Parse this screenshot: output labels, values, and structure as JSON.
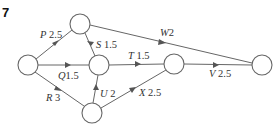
{
  "question_number": "7",
  "nodes": [
    {
      "id": "start",
      "cx": 28,
      "cy": 65
    },
    {
      "id": "top",
      "cx": 80,
      "cy": 24
    },
    {
      "id": "mid",
      "cx": 99,
      "cy": 65
    },
    {
      "id": "bottom",
      "cx": 92,
      "cy": 113
    },
    {
      "id": "right",
      "cx": 174,
      "cy": 64
    },
    {
      "id": "end",
      "cx": 262,
      "cy": 65
    }
  ],
  "edges": [
    {
      "name": "P",
      "weight": "2.5",
      "from": "start",
      "to": "top"
    },
    {
      "name": "Q",
      "weight": "1.5",
      "from": "start",
      "to": "mid"
    },
    {
      "name": "R",
      "weight": "3",
      "from": "start",
      "to": "bottom"
    },
    {
      "name": "S",
      "weight": "1.5",
      "from": "top",
      "to": "mid"
    },
    {
      "name": "W",
      "weight": "2",
      "from": "top",
      "to": "end"
    },
    {
      "name": "T",
      "weight": "1.5",
      "from": "mid",
      "to": "right"
    },
    {
      "name": "U",
      "weight": "2",
      "from": "bottom",
      "to": "mid"
    },
    {
      "name": "X",
      "weight": "2.5",
      "from": "bottom",
      "to": "right"
    },
    {
      "name": "V",
      "weight": "2.5",
      "from": "right",
      "to": "end"
    }
  ],
  "labels": {
    "P": {
      "name": "P",
      "weight": "2.5"
    },
    "Q": {
      "name": "Q",
      "weight": "1.5"
    },
    "R": {
      "name": "R",
      "weight": "3"
    },
    "S": {
      "name": "S",
      "weight": "1.5"
    },
    "W": {
      "name": "W",
      "weight": "2"
    },
    "T": {
      "name": "T",
      "weight": "1.5"
    },
    "U": {
      "name": "U",
      "weight": "2"
    },
    "X": {
      "name": "X",
      "weight": "2.5"
    },
    "V": {
      "name": "V",
      "weight": "2.5"
    }
  }
}
